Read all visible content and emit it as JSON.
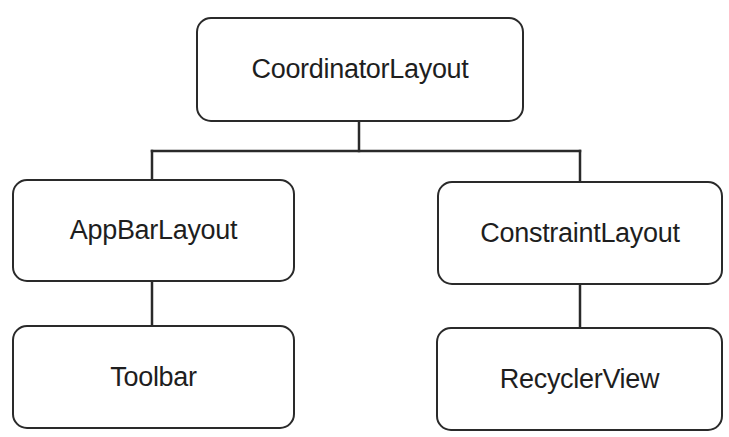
{
  "diagram": {
    "type": "tree",
    "nodes": {
      "root": {
        "label": "CoordinatorLayout"
      },
      "left_child": {
        "label": "AppBarLayout"
      },
      "right_child": {
        "label": "ConstraintLayout"
      },
      "left_grandchild": {
        "label": "Toolbar"
      },
      "right_grandchild": {
        "label": "RecyclerView"
      }
    },
    "edges": [
      {
        "from": "CoordinatorLayout",
        "to": "AppBarLayout"
      },
      {
        "from": "CoordinatorLayout",
        "to": "ConstraintLayout"
      },
      {
        "from": "AppBarLayout",
        "to": "Toolbar"
      },
      {
        "from": "ConstraintLayout",
        "to": "RecyclerView"
      }
    ],
    "colors": {
      "stroke": "#2a2a2a",
      "text": "#1e1e1e",
      "background": "#ffffff"
    }
  }
}
